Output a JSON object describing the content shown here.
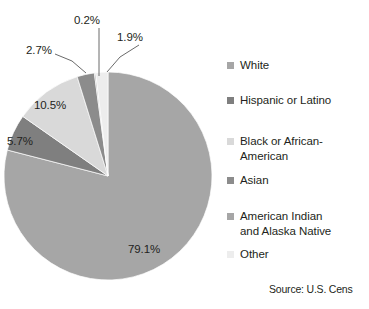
{
  "chart_data": {
    "type": "pie",
    "title": "",
    "subtitle": "",
    "xlabel": "",
    "ylabel": "",
    "categories": [
      "White",
      "Hispanic or Latino",
      "Black or African-American",
      "Asian",
      "American Indian and Alaska Native",
      "Other"
    ],
    "values": [
      79.1,
      5.7,
      10.5,
      2.7,
      0.2,
      1.9
    ],
    "value_labels": [
      "79.1%",
      "5.7%",
      "10.5%",
      "2.7%",
      "0.2%",
      "1.9%"
    ],
    "unit": "%",
    "colors": [
      "#a6a6a6",
      "#7f7f7f",
      "#d9d9d9",
      "#8c8c8c",
      "#a6a6a6",
      "#ededed"
    ],
    "start_angle_deg": 0,
    "direction": "clockwise",
    "legend_position": "right",
    "grid": false,
    "annotations": [
      "Source: U.S. Cens"
    ]
  },
  "legend": {
    "items": [
      {
        "label": "White",
        "color": "#a6a6a6"
      },
      {
        "label": "Hispanic or Latino",
        "color": "#7f7f7f"
      },
      {
        "label": "Black or African-\nAmerican",
        "color": "#d9d9d9"
      },
      {
        "label": "Asian",
        "color": "#8c8c8c"
      },
      {
        "label": "American Indian\nand Alaska Native",
        "color": "#a6a6a6"
      },
      {
        "label": "Other",
        "color": "#ededed"
      }
    ]
  },
  "source": {
    "text": "Source: U.S. Cens"
  }
}
